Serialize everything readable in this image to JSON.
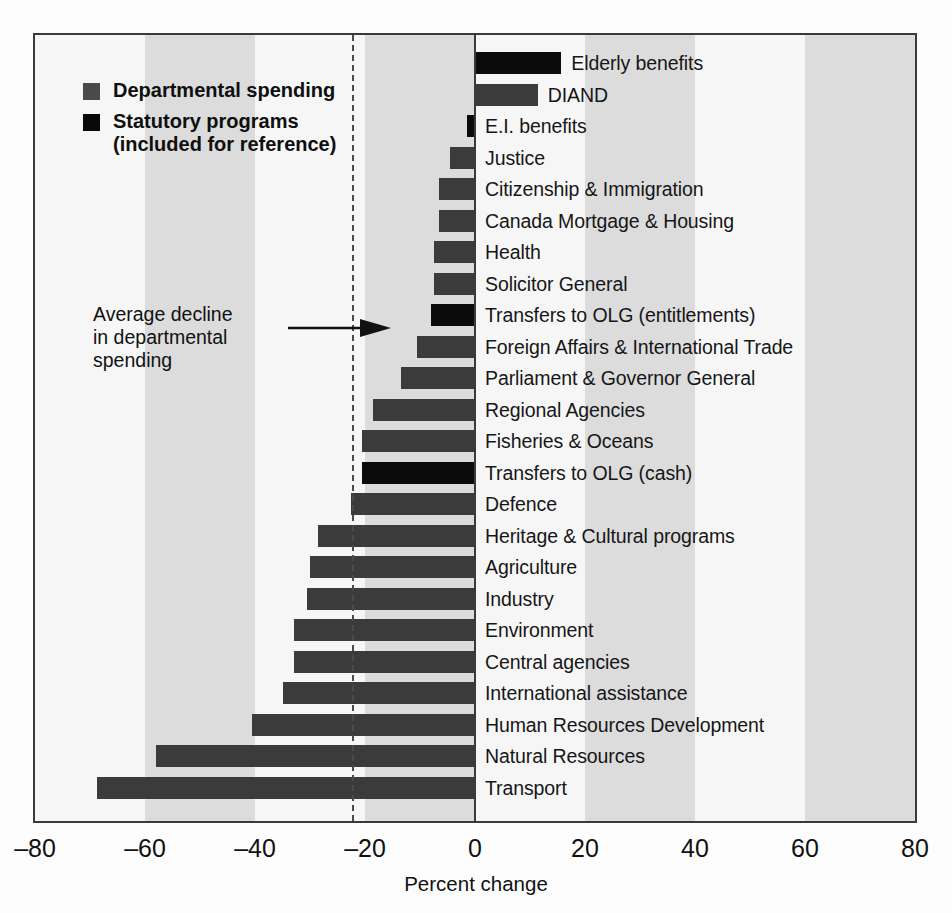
{
  "chart_data": {
    "type": "bar",
    "orientation": "horizontal",
    "title": "",
    "xlabel": "Percent change",
    "ylabel": "",
    "xlim": [
      -80,
      80
    ],
    "xticks": [
      -80,
      -60,
      -40,
      -20,
      0,
      20,
      40,
      60,
      80
    ],
    "xtick_labels": [
      "–80",
      "–60",
      "–40",
      "–20",
      "0",
      "20",
      "40",
      "60",
      "80"
    ],
    "grid": false,
    "banded_background": true,
    "band_width": 20,
    "legend": {
      "position": "top-left",
      "entries": [
        {
          "label": "Departmental spending",
          "color": "#4a4a4a",
          "series": "dept"
        },
        {
          "label": "Statutory programs\n(included for reference)",
          "color": "#090909",
          "series": "stat"
        }
      ]
    },
    "annotations": [
      {
        "text": "Average decline\nin departmental\nspending",
        "kind": "arrow-to-reference-line",
        "target_value": -22.3
      }
    ],
    "reference_line": {
      "value": -22.3,
      "style": "dashed",
      "color": "#4a4a4a"
    },
    "categories": [
      "Elderly benefits",
      "DIAND",
      "E.I. benefits",
      "Justice",
      "Citizenship & Immigration",
      "Canada Mortgage & Housing",
      "Health",
      "Solicitor General",
      "Transfers to OLG (entitlements)",
      "Foreign Affairs & International Trade",
      "Parliament & Governor General",
      "Regional Agencies",
      "Fisheries & Oceans",
      "Transfers to OLG (cash)",
      "Defence",
      "Heritage & Cultural programs",
      "Agriculture",
      "Industry",
      "Environment",
      "Central agencies",
      "International assistance",
      "Human Resources Development",
      "Natural Resources",
      "Transport"
    ],
    "values": [
      15.7,
      11.4,
      -1.5,
      -4.5,
      -6.5,
      -6.5,
      -7.5,
      -7.5,
      -8.0,
      -10.5,
      -13.5,
      -18.5,
      -20.5,
      -20.5,
      -22.5,
      -28.5,
      -30.0,
      -30.5,
      -33.0,
      -33.0,
      -35.0,
      -40.5,
      -58.0,
      -68.8
    ],
    "series_types": [
      "stat",
      "dept",
      "stat",
      "dept",
      "dept",
      "dept",
      "dept",
      "dept",
      "stat",
      "dept",
      "dept",
      "dept",
      "dept",
      "stat",
      "dept",
      "dept",
      "dept",
      "dept",
      "dept",
      "dept",
      "dept",
      "dept",
      "dept",
      "dept"
    ]
  },
  "colors": {
    "dept_bar": "#3b3b3b",
    "stat_bar": "#0b0b0b",
    "band_light": "#f6f6f6",
    "band_dark": "#dcdcdc",
    "frame": "#3a3a3a"
  }
}
